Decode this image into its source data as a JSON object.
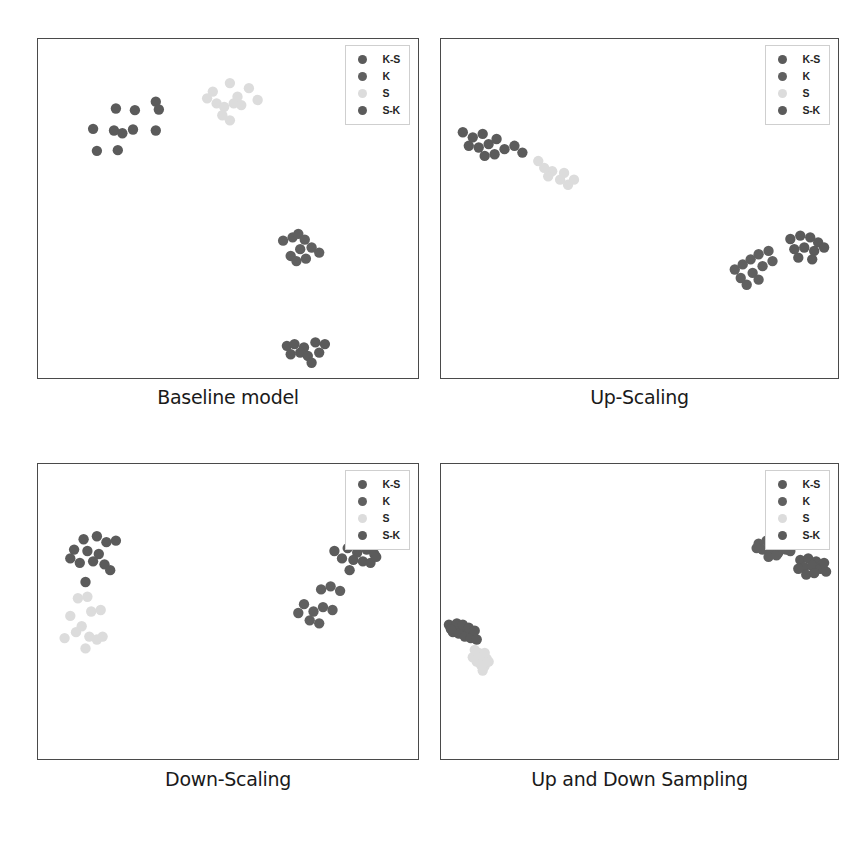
{
  "figure": {
    "title": "",
    "layout": "2x2 grid of scatter plots",
    "background": "#ffffff",
    "width": 860,
    "height": 842
  },
  "legend": {
    "entries": [
      {
        "label": "K-S",
        "color": "#5b5b5b"
      },
      {
        "label": "K",
        "color": "#606060"
      },
      {
        "label": "S",
        "color": "#dcdcdc"
      },
      {
        "label": "S-K",
        "color": "#5b5b5b"
      }
    ],
    "position": "top-right inside axes",
    "border_color": "#cfcfcf"
  },
  "chart_data": [
    {
      "type": "scatter",
      "title": "Baseline model",
      "panel_index": 0,
      "xlabel": "",
      "ylabel": "",
      "xlim": [
        0,
        100
      ],
      "ylim": [
        0,
        100
      ],
      "grid": false,
      "axis_ticks": false,
      "legend_position": "upper right",
      "series": [
        {
          "name": "K-S",
          "color": "#5b5b5b",
          "points": [
            [
              20.5,
              79.5
            ],
            [
              25.5,
              79.0
            ],
            [
              31.0,
              81.5
            ],
            [
              31.8,
              79.2
            ],
            [
              14.5,
              73.5
            ],
            [
              20.0,
              73.0
            ],
            [
              22.2,
              72.2
            ],
            [
              25.0,
              73.3
            ],
            [
              31.0,
              73.0
            ],
            [
              15.5,
              67.0
            ],
            [
              21.0,
              67.2
            ]
          ]
        },
        {
          "name": "S",
          "color": "#dcdcdc",
          "points": [
            [
              46.0,
              84.5
            ],
            [
              50.5,
              87.0
            ],
            [
              55.5,
              85.5
            ],
            [
              47.0,
              81.0
            ],
            [
              49.0,
              80.0
            ],
            [
              51.5,
              81.0
            ],
            [
              53.5,
              80.5
            ],
            [
              57.8,
              82.0
            ],
            [
              48.5,
              77.5
            ],
            [
              50.5,
              76.0
            ],
            [
              44.5,
              82.5
            ],
            [
              52.5,
              83.0
            ]
          ]
        },
        {
          "name": "K",
          "color": "#606060",
          "points": [
            [
              64.5,
              40.5
            ],
            [
              67.0,
              41.5
            ],
            [
              68.5,
              42.5
            ],
            [
              70.2,
              40.8
            ],
            [
              69.0,
              38.0
            ],
            [
              72.0,
              38.5
            ],
            [
              74.0,
              37.0
            ],
            [
              66.5,
              36.0
            ],
            [
              68.0,
              34.5
            ],
            [
              70.5,
              35.2
            ]
          ]
        },
        {
          "name": "S-K",
          "color": "#5b5b5b",
          "points": [
            [
              65.5,
              9.5
            ],
            [
              67.5,
              10.0
            ],
            [
              70.0,
              9.0
            ],
            [
              73.0,
              10.5
            ],
            [
              75.5,
              10.0
            ],
            [
              66.5,
              7.0
            ],
            [
              69.0,
              7.5
            ],
            [
              71.0,
              6.5
            ],
            [
              74.0,
              7.5
            ],
            [
              72.0,
              4.5
            ]
          ]
        }
      ]
    },
    {
      "type": "scatter",
      "title": "Up-Scaling",
      "panel_index": 1,
      "xlabel": "",
      "ylabel": "",
      "xlim": [
        0,
        100
      ],
      "ylim": [
        0,
        100
      ],
      "grid": false,
      "axis_ticks": false,
      "legend_position": "upper right",
      "series": [
        {
          "name": "K-S",
          "color": "#5b5b5b",
          "points": [
            [
              5.5,
              72.5
            ],
            [
              8.0,
              71.0
            ],
            [
              10.5,
              72.0
            ],
            [
              7.0,
              68.5
            ],
            [
              9.5,
              68.0
            ],
            [
              12.0,
              69.0
            ],
            [
              14.0,
              70.5
            ],
            [
              11.0,
              65.5
            ],
            [
              13.5,
              66.0
            ],
            [
              16.0,
              67.5
            ],
            [
              18.5,
              68.5
            ],
            [
              20.5,
              66.5
            ]
          ]
        },
        {
          "name": "S",
          "color": "#dcdcdc",
          "points": [
            [
              24.5,
              64.0
            ],
            [
              26.0,
              62.0
            ],
            [
              28.0,
              61.0
            ],
            [
              30.0,
              58.5
            ],
            [
              32.0,
              57.0
            ],
            [
              33.5,
              58.5
            ],
            [
              27.0,
              59.5
            ],
            [
              31.0,
              60.5
            ]
          ]
        },
        {
          "name": "K",
          "color": "#606060",
          "points": [
            [
              74.0,
              32.0
            ],
            [
              76.0,
              33.5
            ],
            [
              78.0,
              35.0
            ],
            [
              80.0,
              36.5
            ],
            [
              82.5,
              37.5
            ],
            [
              75.5,
              29.5
            ],
            [
              78.5,
              31.0
            ],
            [
              81.0,
              33.0
            ],
            [
              83.5,
              34.5
            ],
            [
              77.0,
              27.5
            ],
            [
              80.0,
              29.0
            ]
          ]
        },
        {
          "name": "S-K",
          "color": "#5b5b5b",
          "points": [
            [
              88.0,
              41.0
            ],
            [
              90.5,
              42.0
            ],
            [
              93.0,
              41.5
            ],
            [
              95.0,
              40.0
            ],
            [
              89.0,
              38.0
            ],
            [
              91.5,
              38.5
            ],
            [
              94.0,
              37.5
            ],
            [
              96.5,
              38.5
            ],
            [
              90.0,
              35.5
            ],
            [
              93.5,
              35.0
            ]
          ]
        }
      ]
    },
    {
      "type": "scatter",
      "title": "Down-Scaling",
      "panel_index": 2,
      "xlabel": "",
      "ylabel": "",
      "xlim": [
        0,
        100
      ],
      "ylim": [
        0,
        100
      ],
      "grid": false,
      "axis_ticks": false,
      "legend_position": "upper right",
      "series": [
        {
          "name": "K-S",
          "color": "#5b5b5b",
          "points": [
            [
              12.0,
              74.5
            ],
            [
              15.5,
              75.5
            ],
            [
              18.0,
              73.5
            ],
            [
              20.5,
              74.0
            ],
            [
              9.5,
              71.0
            ],
            [
              13.0,
              70.5
            ],
            [
              16.0,
              69.5
            ],
            [
              11.0,
              66.5
            ],
            [
              14.5,
              67.0
            ],
            [
              17.5,
              66.0
            ],
            [
              19.0,
              64.0
            ],
            [
              8.5,
              68.0
            ],
            [
              12.5,
              60.0
            ]
          ]
        },
        {
          "name": "S",
          "color": "#dcdcdc",
          "points": [
            [
              10.5,
              54.5
            ],
            [
              13.0,
              55.0
            ],
            [
              14.0,
              50.0
            ],
            [
              16.5,
              50.5
            ],
            [
              8.5,
              48.5
            ],
            [
              11.5,
              45.0
            ],
            [
              13.5,
              41.5
            ],
            [
              7.0,
              41.0
            ],
            [
              15.5,
              40.5
            ],
            [
              17.0,
              41.5
            ],
            [
              12.5,
              37.5
            ],
            [
              10.0,
              43.0
            ]
          ]
        },
        {
          "name": "S-K",
          "color": "#5b5b5b",
          "points": [
            [
              78.0,
              70.5
            ],
            [
              81.5,
              71.5
            ],
            [
              84.0,
              70.0
            ],
            [
              86.5,
              71.0
            ],
            [
              88.5,
              69.5
            ],
            [
              80.0,
              68.0
            ],
            [
              83.0,
              67.5
            ],
            [
              85.5,
              67.0
            ],
            [
              87.5,
              66.5
            ],
            [
              82.0,
              64.0
            ],
            [
              89.0,
              68.5
            ]
          ]
        },
        {
          "name": "K",
          "color": "#606060",
          "points": [
            [
              74.5,
              57.5
            ],
            [
              77.0,
              58.5
            ],
            [
              79.5,
              57.0
            ],
            [
              70.0,
              52.5
            ],
            [
              72.5,
              50.0
            ],
            [
              75.0,
              51.5
            ],
            [
              77.5,
              50.5
            ],
            [
              71.5,
              47.0
            ],
            [
              74.0,
              46.0
            ],
            [
              68.5,
              49.5
            ]
          ]
        }
      ]
    },
    {
      "type": "scatter",
      "title": "Up and Down Sampling",
      "panel_index": 3,
      "xlabel": "",
      "ylabel": "",
      "xlim": [
        0,
        100
      ],
      "ylim": [
        0,
        100
      ],
      "grid": false,
      "axis_ticks": false,
      "legend_position": "upper right",
      "series": [
        {
          "name": "K-S",
          "color": "#5b5b5b",
          "points": [
            [
              2.0,
              45.5
            ],
            [
              3.5,
              45.0
            ],
            [
              5.0,
              44.0
            ],
            [
              6.5,
              43.5
            ],
            [
              8.0,
              42.5
            ],
            [
              3.0,
              43.0
            ],
            [
              4.5,
              42.5
            ],
            [
              6.0,
              41.5
            ],
            [
              7.5,
              41.0
            ],
            [
              9.0,
              40.5
            ],
            [
              4.0,
              46.0
            ],
            [
              5.5,
              45.5
            ],
            [
              2.5,
              44.0
            ],
            [
              7.0,
              44.5
            ],
            [
              8.5,
              43.5
            ]
          ]
        },
        {
          "name": "S",
          "color": "#dcdcdc",
          "points": [
            [
              8.5,
              37.0
            ],
            [
              9.5,
              36.0
            ],
            [
              10.5,
              35.0
            ],
            [
              11.5,
              34.0
            ],
            [
              9.0,
              33.0
            ],
            [
              10.0,
              32.0
            ],
            [
              11.0,
              31.5
            ],
            [
              8.0,
              34.5
            ],
            [
              12.0,
              33.0
            ],
            [
              10.5,
              30.0
            ],
            [
              9.5,
              35.5
            ],
            [
              11.0,
              36.0
            ]
          ]
        },
        {
          "name": "K",
          "color": "#606060",
          "points": [
            [
              80.0,
              73.0
            ],
            [
              82.0,
              74.0
            ],
            [
              84.0,
              73.5
            ],
            [
              86.0,
              72.0
            ],
            [
              81.0,
              71.0
            ],
            [
              83.0,
              70.5
            ],
            [
              85.0,
              70.0
            ],
            [
              87.0,
              71.0
            ],
            [
              82.5,
              68.5
            ],
            [
              84.5,
              69.0
            ],
            [
              79.5,
              71.5
            ],
            [
              88.0,
              70.5
            ]
          ]
        },
        {
          "name": "S-K",
          "color": "#5b5b5b",
          "points": [
            [
              90.5,
              67.5
            ],
            [
              92.5,
              68.0
            ],
            [
              94.5,
              67.0
            ],
            [
              96.0,
              65.5
            ],
            [
              91.5,
              65.0
            ],
            [
              93.5,
              65.5
            ],
            [
              95.5,
              64.5
            ],
            [
              97.0,
              63.5
            ],
            [
              92.0,
              62.5
            ],
            [
              94.0,
              63.0
            ],
            [
              96.5,
              66.5
            ],
            [
              90.0,
              64.5
            ]
          ]
        }
      ]
    }
  ]
}
